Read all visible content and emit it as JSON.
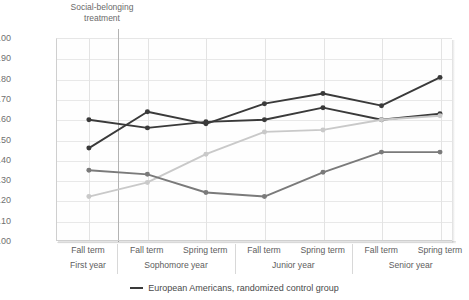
{
  "annotation": {
    "text": "Social-belonging\ntreatment"
  },
  "legend": {
    "entries": [
      {
        "label": "European Americans, randomized control group",
        "color": "#3a3a3a",
        "marker": "line-swatch"
      }
    ]
  },
  "chart_data": {
    "type": "line",
    "title": "",
    "subtitle": "",
    "xlabel": "",
    "ylabel": "",
    "ylim": [
      3.0,
      4.0
    ],
    "ytick_labels": [
      "4.00",
      "3.90",
      "3.80",
      "3.70",
      "3.60",
      "3.50",
      "3.40",
      "3.30",
      "3.20",
      "3.10",
      "3.00"
    ],
    "ytick_values": [
      4.0,
      3.9,
      3.8,
      3.7,
      3.6,
      3.5,
      3.4,
      3.3,
      3.2,
      3.1,
      3.0
    ],
    "grid": true,
    "legend_position": "bottom-center",
    "annotations": [
      {
        "text": "Social-belonging treatment",
        "x_index": 0.5,
        "type": "vertical-divider-label"
      }
    ],
    "categories": [
      "Fall term",
      "Fall term",
      "Spring term",
      "Fall term",
      "Spring term",
      "Fall term",
      "Spring term"
    ],
    "category_groups": [
      {
        "label": "First year",
        "terms": [
          "Fall term"
        ]
      },
      {
        "label": "Sophomore year",
        "terms": [
          "Fall term",
          "Spring term"
        ]
      },
      {
        "label": "Junior year",
        "terms": [
          "Fall term",
          "Spring term"
        ]
      },
      {
        "label": "Senior year",
        "terms": [
          "Fall term",
          "Spring term"
        ]
      }
    ],
    "series": [
      {
        "name": "series-dark-rising",
        "color": "#3a3a3a",
        "values": [
          3.46,
          3.64,
          3.58,
          3.68,
          3.73,
          3.67,
          3.81
        ]
      },
      {
        "name": "series-dark-flat",
        "color": "#3a3a3a",
        "values": [
          3.6,
          3.56,
          3.59,
          3.6,
          3.66,
          3.6,
          3.63
        ]
      },
      {
        "name": "series-light-rising",
        "color": "#c9c9c9",
        "values": [
          3.22,
          3.29,
          3.43,
          3.54,
          3.55,
          3.6,
          3.62
        ]
      },
      {
        "name": "series-medium-dip",
        "color": "#7a7a7a",
        "values": [
          3.35,
          3.33,
          3.24,
          3.22,
          3.34,
          3.44,
          3.44
        ]
      }
    ]
  }
}
